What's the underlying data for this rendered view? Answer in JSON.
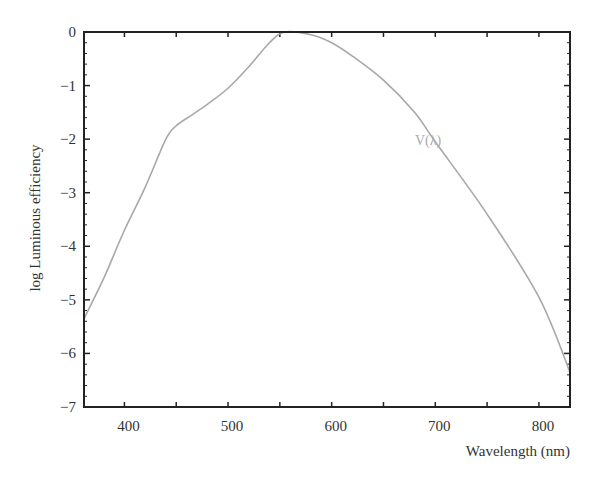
{
  "chart_data": {
    "type": "line",
    "title": "",
    "xlabel": "Wavelength (nm)",
    "ylabel": "log Luminous efficiency",
    "xlim": [
      361,
      830
    ],
    "ylim": [
      -7,
      0
    ],
    "x_ticks": [
      400,
      500,
      600,
      700,
      800
    ],
    "y_ticks": [
      0,
      -1,
      -2,
      -3,
      -4,
      -5,
      -6,
      -7
    ],
    "y_tick_labels": [
      "0",
      "−1",
      "−2",
      "−3",
      "−4",
      "−5",
      "−6",
      "−7"
    ],
    "grid": false,
    "legend": "none",
    "annotations": [
      {
        "text": "V(λ)",
        "x": 690,
        "y": -1.35
      }
    ],
    "series": [
      {
        "name": "V(λ)",
        "color": "#a8a8a8",
        "x": [
          361,
          380,
          400,
          420,
          440,
          450,
          465,
          480,
          500,
          520,
          540,
          555,
          580,
          600,
          620,
          650,
          680,
          700,
          750,
          800,
          830
        ],
        "values": [
          -5.35,
          -4.6,
          -3.7,
          -2.9,
          -2.0,
          -1.75,
          -1.55,
          -1.35,
          -1.05,
          -0.65,
          -0.2,
          0.0,
          -0.05,
          -0.2,
          -0.45,
          -0.9,
          -1.5,
          -2.05,
          -3.4,
          -4.95,
          -6.35
        ]
      }
    ]
  }
}
